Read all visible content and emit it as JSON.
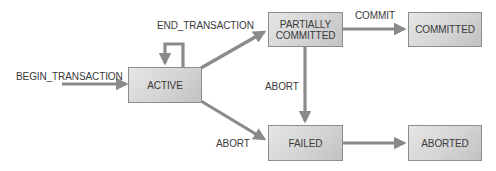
{
  "diagram": {
    "type": "state-transition",
    "colors": {
      "box_fill_light": "#e6e6e6",
      "box_fill_dark": "#c2c2c2",
      "box_border": "#8c8c8c",
      "arrow": "#8a8a8a",
      "text": "#3a3a3a",
      "background": "#ffffff"
    },
    "states": {
      "active": {
        "label": "ACTIVE"
      },
      "partially_committed": {
        "label": "PARTIALLY\nCOMMITTED"
      },
      "committed": {
        "label": "COMMITTED"
      },
      "failed": {
        "label": "FAILED"
      },
      "aborted": {
        "label": "ABORTED"
      }
    },
    "transitions": {
      "begin": {
        "label": "BEGIN_TRANSACTION",
        "from": "",
        "to": "active"
      },
      "end_transaction": {
        "label": "END_TRANSACTION",
        "from": "active",
        "to": "partially_committed"
      },
      "self_loop": {
        "label": "",
        "from": "active",
        "to": "active"
      },
      "commit": {
        "label": "COMMIT",
        "from": "partially_committed",
        "to": "committed"
      },
      "abort_from_partial": {
        "label": "ABORT",
        "from": "partially_committed",
        "to": "failed"
      },
      "abort_from_active": {
        "label": "ABORT",
        "from": "active",
        "to": "failed"
      },
      "failed_to_aborted": {
        "label": "",
        "from": "failed",
        "to": "aborted"
      }
    }
  }
}
